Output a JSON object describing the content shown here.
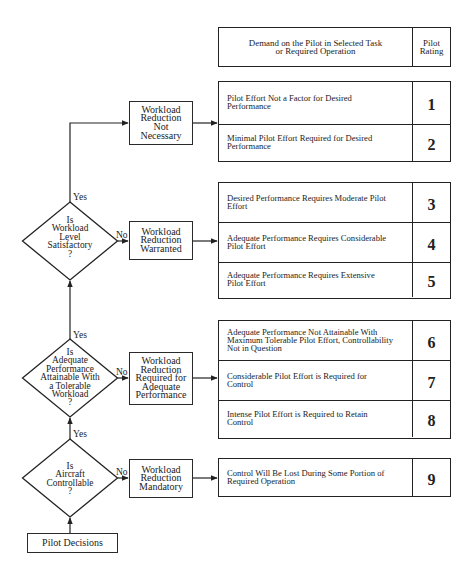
{
  "header": {
    "demand_label": "Demand on the Pilot in Selected Task\nor Required Operation",
    "rating_label": "Pilot\nRating"
  },
  "start": {
    "label": "Pilot Decisions"
  },
  "decisions": [
    {
      "question": "Is\nWorkload\nLevel\nSatisfactory\n?",
      "yes_label": "Yes",
      "no_label": "No"
    },
    {
      "question": "Is\nAdequate\nPerformance\nAttainable With\na Tolerable\nWorkload\n?",
      "yes_label": "Yes",
      "no_label": "No"
    },
    {
      "question": "Is\nAircraft\nControllable\n?",
      "yes_label": "Yes",
      "no_label": "No"
    }
  ],
  "outcomes": [
    {
      "label": "Workload\nReduction\nNot\nNecessary"
    },
    {
      "label": "Workload\nReduction\nWarranted"
    },
    {
      "label": "Workload\nReduction\nRequired for\nAdequate\nPerformance"
    },
    {
      "label": "Workload\nReduction\nMandatory"
    }
  ],
  "rating_groups": [
    {
      "rows": [
        {
          "text": "Pilot Effort Not a Factor for Desired\nPerformance",
          "rating": "1"
        },
        {
          "text": "Minimal Pilot Effort Required for Desired\nPerformance",
          "rating": "2"
        }
      ]
    },
    {
      "rows": [
        {
          "text": "Desired Performance Requires Moderate Pilot\nEffort",
          "rating": "3"
        },
        {
          "text": "Adequate Performance Requires Considerable\nPilot Effort",
          "rating": "4"
        },
        {
          "text": "Adequate Performance Requires Extensive\nPilot Effort",
          "rating": "5"
        }
      ]
    },
    {
      "rows": [
        {
          "text": "Adequate Performance Not Attainable With\nMaximum Tolerable Pilot Effort, Controllability\nNot in Question",
          "rating": "6"
        },
        {
          "text": "Considerable Pilot Effort is Required for\nControl",
          "rating": "7"
        },
        {
          "text": "Intense Pilot Effort is Required to Retain\nControl",
          "rating": "8"
        }
      ]
    },
    {
      "rows": [
        {
          "text": "Control Will Be Lost During Some Portion of\nRequired Operation",
          "rating": "9"
        }
      ]
    }
  ],
  "colors": {
    "line": "#222222",
    "text": "#222222",
    "background": "#ffffff"
  }
}
